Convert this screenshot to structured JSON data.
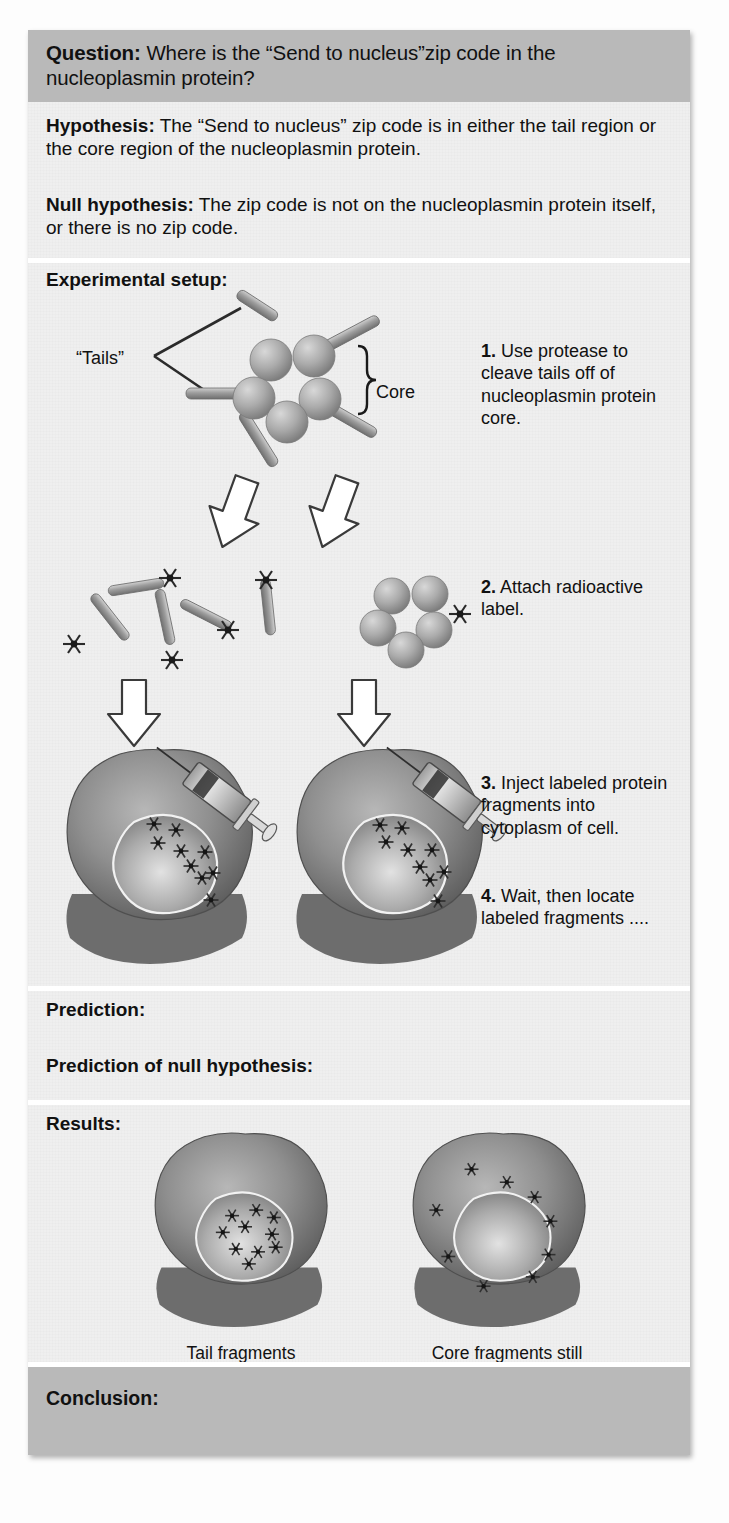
{
  "figure": {
    "question": {
      "label": "Question:",
      "text": "Where is the “Send to nucleus”zip code in the nucleoplasmin protein?"
    },
    "hypothesis": {
      "label": "Hypothesis:",
      "text": "The “Send to nucleus” zip code is in either the tail region or the core region of the nucleoplasmin protein."
    },
    "null_hypothesis": {
      "label": "Null hypothesis:",
      "text": "The zip code is not on the nucleoplasmin protein itself, or there is no zip code."
    },
    "setup": {
      "label": "Experimental setup:",
      "diagram_labels": {
        "tails": "“Tails”",
        "core": "Core"
      },
      "steps": [
        {
          "number": "1.",
          "text": "Use protease to cleave tails off of nucleoplasmin protein core."
        },
        {
          "number": "2.",
          "text": "Attach radioactive label."
        },
        {
          "number": "3.",
          "text": "Inject labeled protein fragments into cytoplasm of cell."
        },
        {
          "number": "4.",
          "text": "Wait, then locate labeled fragments ...."
        }
      ]
    },
    "prediction": {
      "label": "Prediction:",
      "text": ""
    },
    "prediction_null": {
      "label": "Prediction of null hypothesis:",
      "text": ""
    },
    "results": {
      "label": "Results:",
      "captions": [
        "Tail fragments\nlocated in nucleus",
        "Core fragments still\nlocated in cytoplasm"
      ]
    },
    "conclusion": {
      "label": "Conclusion:",
      "text": ""
    },
    "colors": {
      "band": "#b9b9b9",
      "panel": "#efefef",
      "divider": "#ffffff",
      "text": "#111111",
      "cell_cytoplasm": "#8d8d8d",
      "cell_nucleus": "#a8a8a8",
      "protein_sphere": "#a9a9a9",
      "tail_rod": "#9a9a9a"
    }
  }
}
